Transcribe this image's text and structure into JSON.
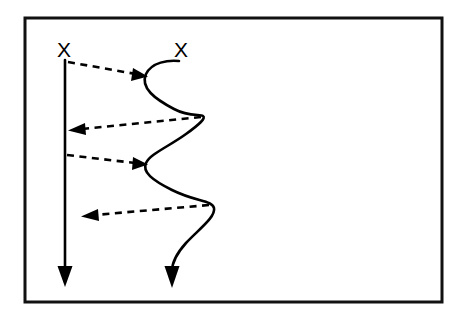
{
  "figure": {
    "background_color": "#ffffff",
    "stroke_color": "#000000",
    "frame": {
      "x": 25,
      "y": 18,
      "width": 417,
      "height": 284,
      "stroke_color": "#111111",
      "stroke_width": 3
    },
    "labels": [
      {
        "id": "left-node-label",
        "text": "X",
        "x": 64,
        "y": 57
      },
      {
        "id": "right-node-label",
        "text": "X",
        "x": 181,
        "y": 57
      }
    ],
    "lifelines": [
      {
        "id": "straight-lifeline",
        "style": "solid",
        "description": "Vertical straight arrow descending from left X",
        "path": "M 65 60 L 65 272",
        "arrow_tip": {
          "x": 65,
          "y": 285
        },
        "arrow_direction": "down"
      },
      {
        "id": "serpentine-lifeline",
        "style": "solid",
        "description": "Wavy serpentine arrow descending from right X",
        "path": "M 179 61 C 168 60, 152 62, 146 74 C 140 88, 155 99, 174 109 C 189 117, 200 114, 203 116 C 206 118, 200 124, 186 134 C 168 147, 150 154, 146 163 C 142 172, 152 180, 172 190 C 196 202, 212 200, 214 208 C 216 217, 198 230, 186 243 C 177 253, 172 262, 172 271",
        "arrow_tip": {
          "x": 172,
          "y": 286
        },
        "arrow_direction": "down"
      }
    ],
    "messages": [
      {
        "id": "message-1",
        "style": "dashed",
        "direction": "right",
        "from": "straight-lifeline",
        "to": "serpentine-lifeline",
        "path": "M 68 62 L 136 74",
        "arrow_tip": {
          "x": 147,
          "y": 76
        }
      },
      {
        "id": "message-2",
        "style": "dashed",
        "direction": "left",
        "from": "serpentine-lifeline",
        "to": "straight-lifeline",
        "path": "M 201 117 L 82 129",
        "arrow_tip": {
          "x": 69,
          "y": 130
        }
      },
      {
        "id": "message-3",
        "style": "dashed",
        "direction": "right",
        "from": "straight-lifeline",
        "to": "serpentine-lifeline",
        "path": "M 67 155 L 135 163",
        "arrow_tip": {
          "x": 147,
          "y": 164
        }
      },
      {
        "id": "message-4",
        "style": "dashed",
        "direction": "left",
        "from": "serpentine-lifeline",
        "to": "straight-lifeline",
        "path": "M 209 205 L 95 215",
        "arrow_tip": {
          "x": 82,
          "y": 216
        }
      }
    ]
  }
}
